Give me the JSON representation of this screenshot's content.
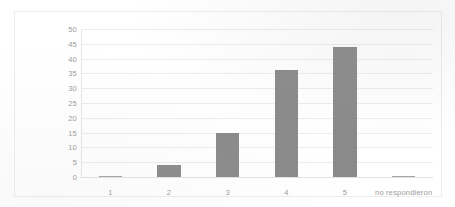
{
  "chart_data": {
    "type": "bar",
    "title": "",
    "subtitle": "",
    "xlabel": "",
    "ylabel": "",
    "categories": [
      "1",
      "2",
      "3",
      "4",
      "5",
      "no respondieron"
    ],
    "values": [
      0,
      4,
      15,
      36,
      44,
      0
    ],
    "series": [
      {
        "name": "",
        "values": [
          0,
          4,
          15,
          36,
          44,
          0
        ]
      }
    ],
    "ylim": [
      0,
      50
    ],
    "ytick_labels": [
      "0",
      "5",
      "10",
      "15",
      "20",
      "25",
      "30",
      "35",
      "40",
      "45",
      "50"
    ],
    "ytick_values": [
      0,
      5,
      10,
      15,
      20,
      25,
      30,
      35,
      40,
      45,
      50
    ],
    "grid": true,
    "grid_axis": "y",
    "legend": false,
    "legend_position": "none",
    "annotations": [],
    "colors": {
      "bar_fill": "#8a8a8a",
      "gridline": "#ececec",
      "axis_line": "#e6e6e6",
      "tick_text": "#9a9a9a",
      "frame_border": "#ededed",
      "background": "#ffffff"
    }
  }
}
